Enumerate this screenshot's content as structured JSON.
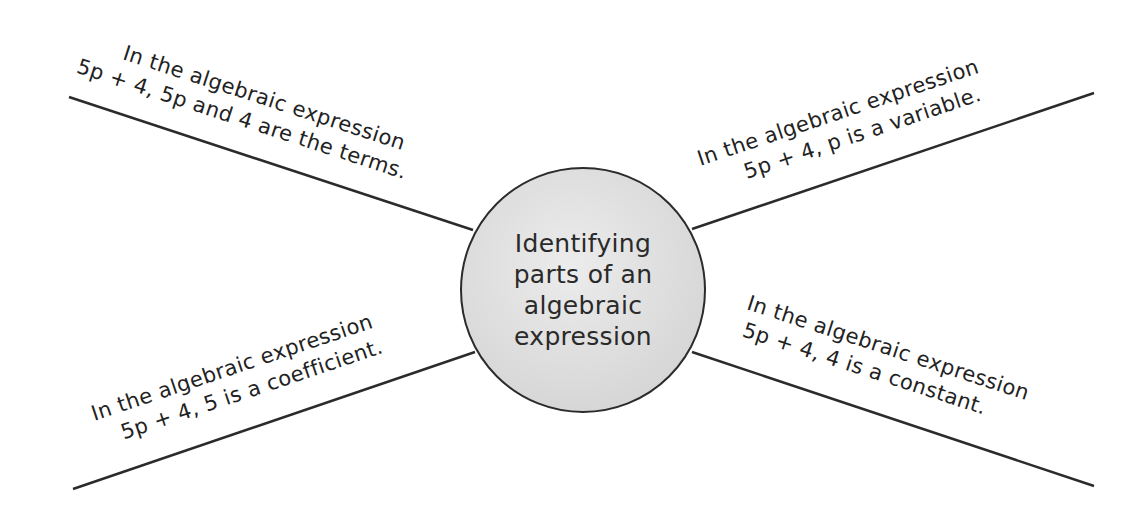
{
  "diagram": {
    "center": {
      "lines": [
        "Identifying",
        "parts of an",
        "algebraic",
        "expression"
      ]
    },
    "spokes": [
      {
        "position": "top-left",
        "line1": "In the algebraic expression",
        "line2": "5p + 4, 5p and 4 are the terms."
      },
      {
        "position": "top-right",
        "line1": "In the algebraic expression",
        "line2": "5p + 4, p  is a variable."
      },
      {
        "position": "bottom-left",
        "line1": "In the algebraic expression",
        "line2": "5p + 4, 5 is a coefficient."
      },
      {
        "position": "bottom-right",
        "line1": "In the algebraic expression",
        "line2": "5p + 4, 4 is a constant."
      }
    ],
    "colors": {
      "line": "#2b2b2b",
      "hub_fill": "#d9d9d9",
      "text": "#222222"
    }
  }
}
